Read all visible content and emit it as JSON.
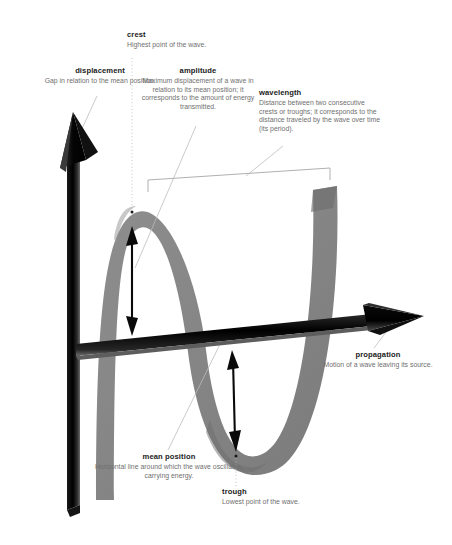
{
  "figure": {
    "background_color": "#ffffff",
    "wave_color": "#8a8a8a",
    "axis_color": "#111111",
    "leader_color": "#b6b6b6",
    "term_color": "#1b1b1b",
    "desc_color": "#6f6f6f"
  },
  "labels": {
    "displacement": {
      "term": "displacement",
      "desc": "Gap in relation to the mean position."
    },
    "crest": {
      "term": "crest",
      "desc": "Highest point of the wave."
    },
    "amplitude": {
      "term": "amplitude",
      "desc": "Maximum displacement of a wave in relation to its mean position; it corresponds to the amount of energy transmitted."
    },
    "wavelength": {
      "term": "wavelength",
      "desc": "Distance between two consecutive crests or troughs; it corresponds to the distance traveled by the wave over time (its period)."
    },
    "propagation": {
      "term": "propagation",
      "desc": "Motion of a wave leaving its source."
    },
    "mean_position": {
      "term": "mean position",
      "desc": "Horizontal line around which the wave oscillates, carrying energy."
    },
    "trough": {
      "term": "trough",
      "desc": "Lowest point of the wave."
    }
  },
  "elements": {
    "vertical_axis": "displacement-axis-arrow",
    "horizontal_axis": "propagation-axis-arrow",
    "wave_ribbon": "sine-wave-ribbon",
    "amplitude_arrow_upper": "amplitude-double-arrow-crest",
    "amplitude_arrow_lower": "amplitude-double-arrow-trough",
    "wavelength_bracket": "wavelength-span-bracket"
  }
}
